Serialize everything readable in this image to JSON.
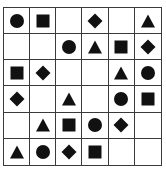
{
  "puzzle": {
    "rows": 6,
    "cols": 6,
    "fill_color": "#111111",
    "line_color": "#3a3a3a",
    "grid": [
      [
        "circle",
        "square",
        "",
        "diamond",
        "",
        "triangle"
      ],
      [
        "",
        "",
        "circle",
        "triangle",
        "square",
        "diamond"
      ],
      [
        "square",
        "diamond",
        "",
        "",
        "triangle",
        "circle"
      ],
      [
        "diamond",
        "",
        "triangle",
        "",
        "circle",
        "square"
      ],
      [
        "",
        "triangle",
        "square",
        "circle",
        "diamond",
        ""
      ],
      [
        "triangle",
        "circle",
        "diamond",
        "square",
        "",
        ""
      ]
    ]
  }
}
